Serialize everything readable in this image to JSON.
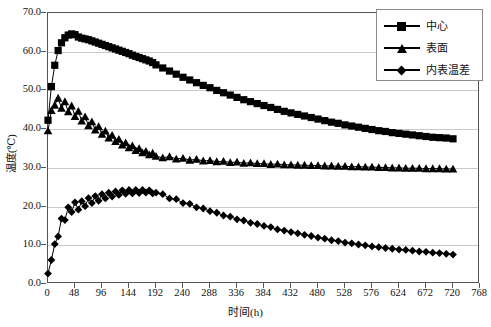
{
  "chart_data": {
    "type": "line",
    "title": "",
    "xlabel": "时间(h)",
    "ylabel": "温度(℃)",
    "xlim": [
      0,
      768
    ],
    "ylim": [
      0,
      70
    ],
    "xticks": [
      0,
      48,
      96,
      144,
      192,
      240,
      288,
      336,
      384,
      432,
      480,
      528,
      576,
      624,
      672,
      720,
      768
    ],
    "yticks": [
      "0.0",
      "10.0",
      "20.0",
      "30.0",
      "40.0",
      "50.0",
      "60.0",
      "70.0"
    ],
    "ytick_values": [
      0,
      10,
      20,
      30,
      40,
      50,
      60,
      70
    ],
    "grid": "horizontal",
    "legend_position": "top-right",
    "legend": [
      "中心",
      "表面",
      "内表温差"
    ],
    "series": [
      {
        "name": "中心",
        "marker": "square",
        "x": [
          0,
          6,
          12,
          18,
          24,
          30,
          36,
          42,
          48,
          54,
          60,
          66,
          72,
          78,
          84,
          90,
          96,
          102,
          108,
          114,
          120,
          126,
          132,
          138,
          144,
          150,
          156,
          162,
          168,
          174,
          180,
          186,
          192,
          204,
          216,
          228,
          240,
          252,
          264,
          276,
          288,
          300,
          312,
          324,
          336,
          348,
          360,
          372,
          384,
          396,
          408,
          420,
          432,
          444,
          456,
          468,
          480,
          492,
          504,
          516,
          528,
          540,
          552,
          564,
          576,
          588,
          600,
          612,
          624,
          636,
          648,
          660,
          672,
          684,
          696,
          708,
          720
        ],
        "y": [
          42.3,
          51.0,
          56.5,
          60.3,
          62.3,
          63.6,
          64.3,
          64.6,
          64.4,
          63.8,
          63.5,
          63.3,
          63.1,
          62.8,
          62.5,
          62.2,
          61.9,
          61.6,
          61.3,
          61.0,
          60.7,
          60.4,
          60.1,
          59.8,
          59.5,
          59.1,
          58.8,
          58.5,
          58.2,
          57.9,
          57.6,
          57.2,
          56.6,
          55.8,
          55.0,
          54.2,
          53.4,
          52.7,
          52.0,
          51.3,
          50.7,
          50.0,
          49.4,
          48.8,
          48.2,
          47.6,
          47.1,
          46.6,
          46.1,
          45.6,
          45.1,
          44.6,
          44.2,
          43.8,
          43.4,
          43.0,
          42.6,
          42.2,
          41.8,
          41.5,
          41.1,
          40.8,
          40.5,
          40.2,
          39.9,
          39.6,
          39.4,
          39.1,
          38.9,
          38.7,
          38.5,
          38.3,
          38.1,
          37.9,
          37.8,
          37.7,
          37.5
        ]
      },
      {
        "name": "表面",
        "marker": "triangle",
        "x": [
          0,
          6,
          12,
          18,
          24,
          30,
          36,
          42,
          48,
          54,
          60,
          66,
          72,
          78,
          84,
          90,
          96,
          102,
          108,
          114,
          120,
          126,
          132,
          138,
          144,
          150,
          156,
          162,
          168,
          174,
          180,
          186,
          192,
          204,
          216,
          228,
          240,
          252,
          264,
          276,
          288,
          300,
          312,
          324,
          336,
          348,
          360,
          372,
          384,
          396,
          408,
          420,
          432,
          444,
          456,
          468,
          480,
          492,
          504,
          516,
          528,
          540,
          552,
          564,
          576,
          588,
          600,
          612,
          624,
          636,
          648,
          660,
          672,
          684,
          696,
          708,
          720
        ],
        "y": [
          39.6,
          44.8,
          46.2,
          48.0,
          45.4,
          47.1,
          44.5,
          46.0,
          43.3,
          44.6,
          42.1,
          43.2,
          40.9,
          41.9,
          39.8,
          40.7,
          38.7,
          39.5,
          37.7,
          38.4,
          36.8,
          37.4,
          35.9,
          36.5,
          35.2,
          35.7,
          34.5,
          35.0,
          33.9,
          34.3,
          33.4,
          33.8,
          33.0,
          32.6,
          32.9,
          32.3,
          32.5,
          32.0,
          32.2,
          31.8,
          31.9,
          31.6,
          31.7,
          31.4,
          31.5,
          31.2,
          31.3,
          31.1,
          31.1,
          30.9,
          31.0,
          30.8,
          30.8,
          30.7,
          30.7,
          30.6,
          30.6,
          30.5,
          30.5,
          30.4,
          30.4,
          30.3,
          30.3,
          30.2,
          30.2,
          30.1,
          30.1,
          30.0,
          30.0,
          29.9,
          29.9,
          29.9,
          29.8,
          29.8,
          29.8,
          29.7,
          29.7
        ]
      },
      {
        "name": "内表温差",
        "marker": "diamond",
        "x": [
          0,
          6,
          12,
          18,
          24,
          30,
          36,
          42,
          48,
          54,
          60,
          66,
          72,
          78,
          84,
          90,
          96,
          102,
          108,
          114,
          120,
          126,
          132,
          138,
          144,
          150,
          156,
          162,
          168,
          174,
          180,
          186,
          192,
          204,
          216,
          228,
          240,
          252,
          264,
          276,
          288,
          300,
          312,
          324,
          336,
          348,
          360,
          372,
          384,
          396,
          408,
          420,
          432,
          444,
          456,
          468,
          480,
          492,
          504,
          516,
          528,
          540,
          552,
          564,
          576,
          588,
          600,
          612,
          624,
          636,
          648,
          660,
          672,
          684,
          696,
          708,
          720
        ],
        "y": [
          2.7,
          6.2,
          10.3,
          12.3,
          16.9,
          16.5,
          19.8,
          18.6,
          21.1,
          19.2,
          21.4,
          20.1,
          22.2,
          20.9,
          22.7,
          21.5,
          23.2,
          22.1,
          23.6,
          22.6,
          23.9,
          23.0,
          24.2,
          23.3,
          24.3,
          23.4,
          24.3,
          23.5,
          24.3,
          23.6,
          24.2,
          23.4,
          23.6,
          23.2,
          22.1,
          21.9,
          20.9,
          20.7,
          19.8,
          19.5,
          18.8,
          18.4,
          17.7,
          17.4,
          16.7,
          16.4,
          15.8,
          15.5,
          15.0,
          14.7,
          14.1,
          13.8,
          13.4,
          13.1,
          12.7,
          12.4,
          12.0,
          11.7,
          11.3,
          11.1,
          10.7,
          10.5,
          10.2,
          10.0,
          9.7,
          9.5,
          9.3,
          9.1,
          8.9,
          8.8,
          8.6,
          8.4,
          8.3,
          8.1,
          8.0,
          7.8,
          7.6
        ]
      }
    ]
  },
  "colors": {
    "series": "#000000",
    "grid": "#c9c9c9",
    "axis": "#555555",
    "legend_border": "#8a8a8a",
    "background": "#ffffff"
  }
}
